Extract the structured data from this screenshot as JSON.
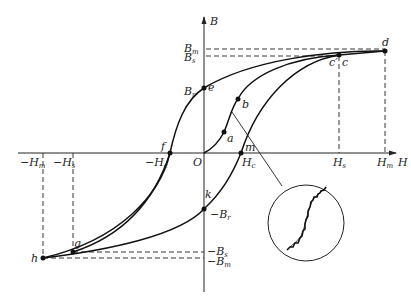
{
  "diagram": {
    "type": "hysteresis-loop",
    "axes": {
      "x_label": "H",
      "y_label": "B",
      "origin_label": "O"
    },
    "x_ticks": [
      {
        "label": "−H",
        "sub": "m",
        "id": "neg_hm"
      },
      {
        "label": "−H",
        "sub": "s",
        "id": "neg_hs"
      },
      {
        "label": "−H",
        "sub": "c",
        "id": "neg_hc"
      },
      {
        "label": "H",
        "sub": "c",
        "id": "hc"
      },
      {
        "label": "H",
        "sub": "s",
        "id": "hs"
      },
      {
        "label": "H",
        "sub": "m",
        "id": "hm"
      }
    ],
    "y_ticks": [
      {
        "label": "B",
        "sub": "m",
        "id": "bm"
      },
      {
        "label": "B",
        "sub": "s",
        "id": "bs"
      },
      {
        "label": "B",
        "sub": "r",
        "id": "br"
      },
      {
        "label": "−B",
        "sub": "r",
        "id": "neg_br"
      },
      {
        "label": "−B",
        "sub": "s",
        "id": "neg_bs"
      },
      {
        "label": "−B",
        "sub": "m",
        "id": "neg_bm"
      }
    ],
    "points": {
      "a": "a",
      "b": "b",
      "c": "c",
      "c_prime": "c′",
      "d": "d",
      "e": "e",
      "f": "f",
      "g": "g",
      "h": "h",
      "k": "k",
      "m": "m"
    },
    "inset": {
      "description": "magnified view of curve segment showing Barkhausen jumps (stepwise)"
    }
  }
}
